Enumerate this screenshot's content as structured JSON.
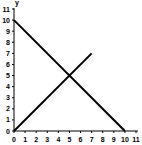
{
  "chart_data": {
    "type": "line",
    "title": "",
    "xlabel": "",
    "ylabel": "y",
    "xlim": [
      0,
      11
    ],
    "ylim": [
      0,
      11
    ],
    "x_ticks": [
      0,
      1,
      2,
      3,
      4,
      5,
      6,
      7,
      8,
      9,
      10,
      11
    ],
    "y_ticks": [
      0,
      1,
      2,
      3,
      4,
      5,
      6,
      7,
      8,
      9,
      10,
      11
    ],
    "grid": false,
    "legend": null,
    "series": [
      {
        "name": "decreasing line",
        "x": [
          0,
          10
        ],
        "y": [
          10,
          0
        ],
        "color": "#000000"
      },
      {
        "name": "increasing line",
        "x": [
          0,
          7
        ],
        "y": [
          0,
          7
        ],
        "color": "#000000"
      }
    ],
    "annotations": [
      {
        "text": "intersection",
        "x": 5,
        "y": 5
      }
    ]
  },
  "axis": {
    "y_label": "y"
  }
}
